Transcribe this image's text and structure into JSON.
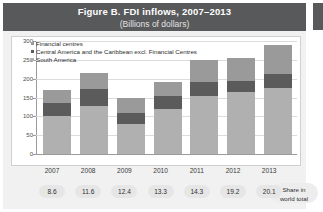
{
  "figure": {
    "title": "Figure B. FDI inflows, 2007–2013",
    "subtitle": "(Billions of dollars)"
  },
  "share_row": {
    "caption_line1": "Share in",
    "caption_line2": "world total",
    "values": [
      "8.6",
      "11.6",
      "12.4",
      "13.3",
      "14.3",
      "19.2",
      "20.1"
    ]
  },
  "colors": {
    "title_bar": "#58595b",
    "panel_bg": "#ffffff",
    "figure_bg": "#f1f1f1",
    "financial_centres": "#9a9a9a",
    "central_america": "#5b5b5b",
    "south_america": "#b0b0b0",
    "gridline": "#dcdcdc",
    "axis": "#9a9a9a",
    "pill_bg": "#e6e6e6"
  },
  "chart_data": {
    "type": "bar",
    "stacked": true,
    "title": "Figure B. FDI inflows, 2007–2013",
    "subtitle": "(Billions of dollars)",
    "xlabel": "",
    "ylabel": "",
    "ylim": [
      0,
      300
    ],
    "yticks": [
      0,
      50,
      100,
      150,
      200,
      250,
      300
    ],
    "ytick_labels": [
      "0",
      "50",
      "100",
      "150",
      "200",
      "250",
      "300"
    ],
    "grid": true,
    "legend_position": "top-left",
    "categories": [
      "2007",
      "2008",
      "2009",
      "2010",
      "2011",
      "2012",
      "2013"
    ],
    "series": [
      {
        "name": "South America",
        "color": "#b0b0b0",
        "values": [
          100,
          128,
          80,
          120,
          155,
          165,
          175
        ]
      },
      {
        "name": "Central America and the Caribbean excl. Financial Centres",
        "color": "#5b5b5b",
        "values": [
          35,
          45,
          30,
          35,
          35,
          30,
          38
        ]
      },
      {
        "name": "Financial centres",
        "color": "#9a9a9a",
        "values": [
          35,
          42,
          40,
          35,
          60,
          60,
          77
        ]
      }
    ],
    "totals": [
      170,
      215,
      150,
      190,
      250,
      255,
      290
    ],
    "legend_order": [
      "Financial centres",
      "Central America and the Caribbean excl. Financial Centres",
      "South America"
    ]
  }
}
